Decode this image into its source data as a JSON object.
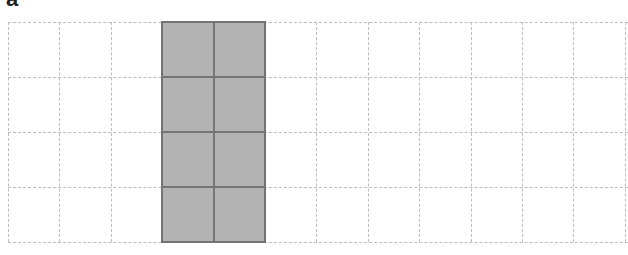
{
  "figure": {
    "panel_label": "a",
    "grid": {
      "rows": 4,
      "visible_columns": 11,
      "cell_width": 51.4,
      "cell_height": 55,
      "line_color": "#bdbdbd",
      "line_style": "dashed",
      "cropped_right": true
    },
    "shaded_region": {
      "start_column": 3,
      "column_span": 2,
      "start_row": 0,
      "row_span": 4,
      "fill_color": "#b3b3b3",
      "border_color": "#747474"
    }
  }
}
